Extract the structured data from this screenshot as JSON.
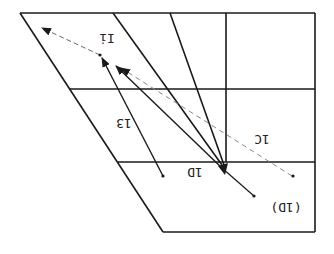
{
  "diagram": {
    "type": "rotated-grid-vector-diagram",
    "orientation": "rotated 180 degrees (labels appear upside down)",
    "stroke_color": "#1a1a1a",
    "dashed_color": "#777777",
    "labels": {
      "region_top": "Ii",
      "vector_13": "13",
      "vector_1c": "1C",
      "vector_1d": "1D",
      "vector_1d_paren": "(1D)"
    },
    "grid": {
      "rows": 3,
      "columns": 3,
      "horizontal_lines_y": [
        13,
        89,
        162,
        232
      ],
      "vertical_line_x": 226
    },
    "vectors": [
      {
        "name": "13",
        "from": [
          163,
          176
        ],
        "to": [
          102,
          57
        ],
        "style": "solid"
      },
      {
        "name": "main",
        "from": [
          222,
          168
        ],
        "to": [
          116,
          66
        ],
        "style": "solid"
      },
      {
        "name": "1C",
        "from": [
          292,
          176
        ],
        "to": [
          120,
          68
        ],
        "style": "dashed"
      },
      {
        "name": "Ii",
        "from": [
          100,
          55
        ],
        "to": [
          42,
          28
        ],
        "style": "dashed"
      },
      {
        "name": "1D",
        "from": [
          254,
          196
        ],
        "to": [
          222,
          168
        ],
        "style": "solid"
      }
    ]
  }
}
